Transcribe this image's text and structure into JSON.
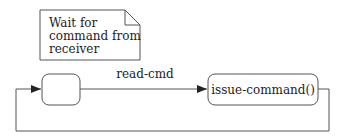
{
  "note": {
    "lines": [
      "Wait for",
      "command from",
      "receiver"
    ]
  },
  "states": {
    "initial": {
      "label": ""
    },
    "issue": {
      "label": "issue-command()"
    }
  },
  "transitions": {
    "read": {
      "label": "read-cmd"
    }
  },
  "colors": {
    "stroke": "#555555",
    "text": "#222222",
    "background": "#ffffff"
  }
}
